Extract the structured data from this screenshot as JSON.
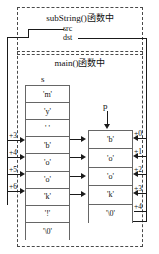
{
  "diagram": {
    "frames": [
      {
        "id": "substring-frame",
        "title": "subString()函数中"
      },
      {
        "id": "main-frame",
        "title": "main()函数中"
      }
    ],
    "pointers": {
      "src": "src",
      "dst": "dst",
      "s": "s",
      "p": "p"
    },
    "arrays": {
      "s": {
        "name": "s",
        "cells": [
          "'m'",
          "'y'",
          "' '",
          "'b'",
          "'o'",
          "'o'",
          "'k'",
          "'!'",
          "'\\0'"
        ]
      },
      "p": {
        "name": "p",
        "cells": [
          "'b'",
          "'o'",
          "'o'",
          "'k'",
          "'\\0'"
        ]
      }
    },
    "offsets": {
      "src_side": [
        "+3",
        "+4",
        "+5",
        "+6"
      ],
      "dst_side": [
        "+0",
        "+1",
        "+2",
        "+3",
        "+4"
      ]
    },
    "colors": {
      "line": "#1a1a1a",
      "box_border": "#666666",
      "dashed_border": "#4a4a4a",
      "text": "#111111",
      "background": "#ffffff"
    }
  }
}
